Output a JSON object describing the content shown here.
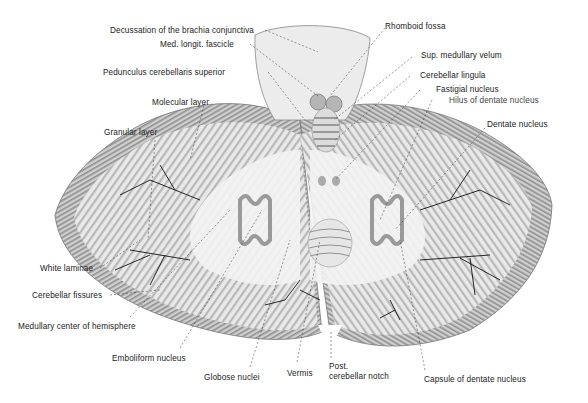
{
  "figure": {
    "colors": {
      "background": "#ffffff",
      "tissue_light": "#ededed",
      "tissue_mid": "#bdbdbd",
      "tissue_dark": "#8a8a8a",
      "line": "#111111",
      "text": "#222222"
    }
  },
  "labels": {
    "decussation": "Decussation of the brachia conjunctiva",
    "med_longit": "Med. longit. fascicle",
    "pedunculus": "Pedunculus cerebellaris superior",
    "molecular": "Molecular layer",
    "granular": "Granular layer",
    "white_laminae": "White laminae",
    "fissures": "Cerebellar fissures",
    "medullary_center": "Medullary center of hemisphere",
    "emboliform": "Emboliform nucleus",
    "globose": "Globose nuclei",
    "vermis": "Vermis",
    "post_notch_1": "Post.",
    "post_notch_2": "cerebellar notch",
    "capsule_dentate": "Capsule of dentate nucleus",
    "rhomboid": "Rhomboid fossa",
    "sup_velum": "Sup. medullary velum",
    "lingula": "Cerebellar lingula",
    "fastigial": "Fastigial nucleus",
    "hilus": "Hilus of dentate nucleus",
    "dentate": "Dentate nucleus"
  }
}
